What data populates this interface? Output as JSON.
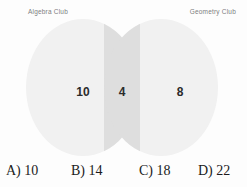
{
  "diagram": {
    "type": "venn",
    "sets": [
      {
        "id": "algebra",
        "label": "Algebra Club"
      },
      {
        "id": "geometry",
        "label": "Geometry Club"
      }
    ],
    "regions": [
      {
        "id": "algebra-only",
        "value": "10"
      },
      {
        "id": "intersection",
        "value": "4"
      },
      {
        "id": "geometry-only",
        "value": "8"
      }
    ],
    "colors": {
      "circle_fill": "#f1f1f1",
      "overlap_fill": "#dedede",
      "label_text": "#7d7d7d",
      "count_text": "#2b2b2b",
      "background": "#fdfdfd"
    }
  },
  "answers": {
    "choices": [
      {
        "id": "a",
        "text": "A) 10"
      },
      {
        "id": "b",
        "text": "B) 14"
      },
      {
        "id": "c",
        "text": "C) 18"
      },
      {
        "id": "d",
        "text": "D) 22"
      }
    ]
  }
}
